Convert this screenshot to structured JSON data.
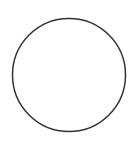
{
  "shape": {
    "type": "circle",
    "cx": 69,
    "cy": 75,
    "r": 56.5,
    "stroke": "#333333",
    "stroke_width": 1.5,
    "fill": "#ffffff"
  },
  "background": "#ffffff"
}
